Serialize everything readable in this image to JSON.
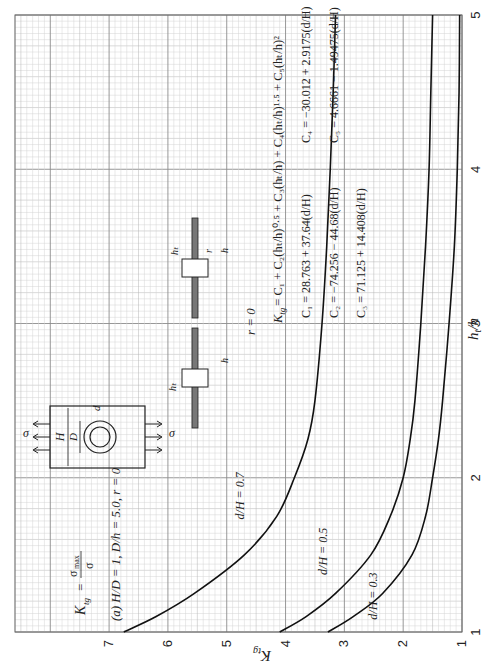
{
  "chart_data": {
    "type": "line",
    "orientation_note": "figure printed rotated 90 degrees counter-clockwise",
    "definition": "K_tg = σ_max / σ",
    "xlabel": "h_t/h",
    "ylabel": "K_tg",
    "xlim": [
      1,
      5
    ],
    "ylim": [
      1,
      8.6
    ],
    "xticks": [
      "1",
      "2",
      "3",
      "4",
      "5"
    ],
    "yticks": [
      "1",
      "2",
      "3",
      "4",
      "5",
      "6",
      "7"
    ],
    "grid": true,
    "series": [
      {
        "name": "d/H = 0.7",
        "x": [
          1.0,
          1.1,
          1.25,
          1.5,
          1.75,
          2.0,
          2.25,
          2.5,
          3.0,
          3.5,
          4.0,
          4.5,
          5.0
        ],
        "y": [
          6.75,
          6.2,
          5.55,
          4.7,
          4.15,
          3.85,
          3.62,
          3.5,
          3.38,
          3.3,
          3.24,
          3.19,
          3.15
        ]
      },
      {
        "name": "d/H = 0.5",
        "x": [
          1.0,
          1.1,
          1.25,
          1.5,
          1.75,
          2.0,
          2.25,
          2.5,
          3.0,
          3.5,
          4.0,
          4.5,
          5.0
        ],
        "y": [
          4.1,
          3.65,
          3.15,
          2.55,
          2.22,
          2.0,
          1.88,
          1.8,
          1.7,
          1.62,
          1.56,
          1.53,
          1.5
        ]
      },
      {
        "name": "d/H = 0.3",
        "x": [
          1.0,
          1.1,
          1.25,
          1.5,
          1.75,
          2.0,
          2.25,
          2.5,
          3.0,
          3.5,
          4.0,
          4.5,
          5.0
        ],
        "y": [
          3.28,
          2.85,
          2.35,
          1.85,
          1.62,
          1.5,
          1.4,
          1.33,
          1.22,
          1.13,
          1.08,
          1.05,
          1.04
        ]
      }
    ],
    "annotations": {
      "curve_labels": [
        "d/H = 0.7",
        "d/H = 0.5",
        "d/H = 0.3"
      ],
      "formula": "K_tg = C1 + C2 (h_t/h)^0.5 + C3 (h_t/h) + C4 (h_t/h)^1.5 + C5 (h_t/h)^2",
      "coefficients": [
        "C1 = 28.763 + 37.64 (d/H)",
        "C2 = −74.256 − 44.68 (d/H)",
        "C3 = 71.125 + 14.408 (d/H)",
        "C4 = −30.012 + 2.9175 (d/H)",
        "C5 = 4.6661 − 1.49475 (d/H)"
      ],
      "diagram_labels": [
        "σ",
        "σ",
        "H",
        "D",
        "d",
        "h",
        "h",
        "h_t",
        "h_t",
        "r",
        "r = 0"
      ]
    }
  },
  "labels": {
    "title_prefix": "(a)",
    "title_main": "H/D = 1, D/h = 5.0, r = 0",
    "ktg": "K",
    "ktg_sub": "tg",
    "eq": "=",
    "sigma_max": "σ",
    "sigma_max_sub": "max",
    "sigma": "σ",
    "xlabel_main": "h",
    "xlabel_sub": "t",
    "xlabel_tail": "/h",
    "r_zero": "r = 0",
    "formula_line": "= C₁ + C₂(hₜ/h)⁰·⁵ + C₃(hₜ/h) + C₄(hₜ/h)¹·⁵ + C₅(hₜ/h)²",
    "c1": "C₁ = 28.763 + 37.64(d/H)",
    "c2": "C₂ = −74.256 − 44.68(d/H)",
    "c3": "C₃ = 71.125 + 14.408(d/H)",
    "c4": "C₄ = −30.012 + 2.9175(d/H)",
    "c5": "C₅ = 4.6661 − 1.49475(d/H)",
    "diag_H": "H",
    "diag_D": "D",
    "diag_d": "d",
    "diag_h": "h",
    "diag_ht": "hₜ",
    "diag_r": "r"
  },
  "colors": {
    "curve": "#111111",
    "grid_minor": "#d4d4d4",
    "grid_mid": "#b5b5b5",
    "grid_major": "#8c8c8c",
    "text": "#222222"
  }
}
